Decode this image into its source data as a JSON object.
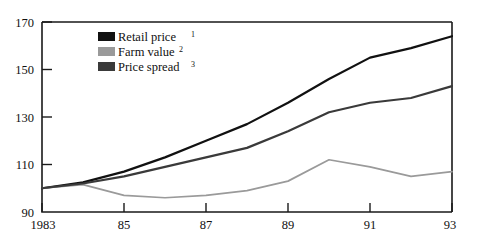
{
  "chart_data": {
    "type": "line",
    "title": "",
    "xlabel": "",
    "ylabel": "",
    "xlim": [
      1983,
      1993
    ],
    "ylim": [
      90,
      170
    ],
    "grid": false,
    "legend_position": "top-left-inside",
    "y_ticks": [
      90,
      110,
      130,
      150,
      170
    ],
    "y_tick_labels": [
      "90",
      "110",
      "130",
      "150",
      "170"
    ],
    "x_ticks": [
      1983,
      1985,
      1987,
      1989,
      1991,
      1993
    ],
    "x_tick_labels": [
      "1983",
      "85",
      "87",
      "89",
      "91",
      "93"
    ],
    "x": [
      1983,
      1984,
      1985,
      1986,
      1987,
      1988,
      1989,
      1990,
      1991,
      1992,
      1993
    ],
    "series": [
      {
        "name": "Retail price",
        "footnote": "1",
        "color": "#111111",
        "values": [
          100,
          102.5,
          107,
          113,
          120,
          127,
          136,
          146,
          155,
          159,
          164
        ]
      },
      {
        "name": "Farm value",
        "footnote": "2",
        "color": "#9a9a9a",
        "values": [
          100,
          101.5,
          97,
          96,
          97,
          99,
          103,
          112,
          109,
          105,
          107
        ]
      },
      {
        "name": "Price spread",
        "footnote": "3",
        "color": "#3a3a3a",
        "values": [
          100,
          102,
          105,
          109,
          113,
          117,
          124,
          132,
          136,
          138,
          143
        ]
      }
    ]
  },
  "legend": {
    "items": [
      {
        "label": "Retail price",
        "sup": "1",
        "swatch": "#111111"
      },
      {
        "label": "Farm value",
        "sup": "2",
        "swatch": "#9a9a9a"
      },
      {
        "label": "Price spread",
        "sup": "3",
        "swatch": "#3a3a3a"
      }
    ]
  }
}
